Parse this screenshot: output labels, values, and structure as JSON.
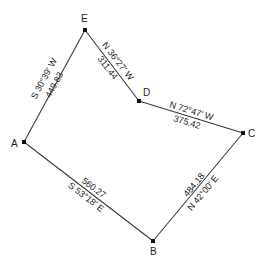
{
  "diagram": {
    "type": "traverse-survey-plot",
    "vertices": [
      {
        "id": "A",
        "label": "A"
      },
      {
        "id": "B",
        "label": "B"
      },
      {
        "id": "C",
        "label": "C"
      },
      {
        "id": "D",
        "label": "D"
      },
      {
        "id": "E",
        "label": "E"
      }
    ],
    "edges": [
      {
        "from": "E",
        "to": "A",
        "bearing": "S 30°39′ W",
        "distance": "449.83"
      },
      {
        "from": "D",
        "to": "E",
        "bearing": "N 36°27′ W",
        "distance": "311.44"
      },
      {
        "from": "C",
        "to": "D",
        "bearing": "N 72°47′ W",
        "distance": "375.42"
      },
      {
        "from": "A",
        "to": "B",
        "bearing": "S 53°18′ E",
        "distance": "560.27"
      },
      {
        "from": "B",
        "to": "C",
        "bearing": "N 42°00′ E",
        "distance": "484.18"
      }
    ]
  }
}
